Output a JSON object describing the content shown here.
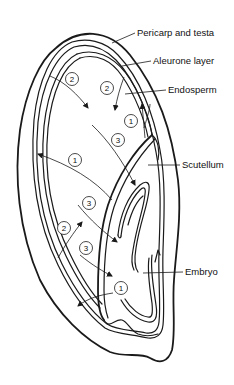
{
  "diagram": {
    "labels": [
      {
        "id": "pericarp",
        "text": "Pericarp and testa",
        "x": 137,
        "y": 36
      },
      {
        "id": "aleurone",
        "text": "Aleurone layer",
        "x": 153,
        "y": 64
      },
      {
        "id": "endosperm",
        "text": "Endosperm",
        "x": 168,
        "y": 93
      },
      {
        "id": "scutellum",
        "text": "Scutellum",
        "x": 182,
        "y": 167
      },
      {
        "id": "embryo",
        "text": "Embryo",
        "x": 185,
        "y": 275
      }
    ],
    "step_markers": [
      {
        "num": "2",
        "x": 72,
        "y": 79
      },
      {
        "num": "2",
        "x": 107,
        "y": 88
      },
      {
        "num": "1",
        "x": 131,
        "y": 121
      },
      {
        "num": "3",
        "x": 118,
        "y": 140
      },
      {
        "num": "1",
        "x": 75,
        "y": 160
      },
      {
        "num": "3",
        "x": 89,
        "y": 203
      },
      {
        "num": "2",
        "x": 64,
        "y": 228
      },
      {
        "num": "3",
        "x": 86,
        "y": 248
      },
      {
        "num": "1",
        "x": 121,
        "y": 288
      }
    ]
  }
}
